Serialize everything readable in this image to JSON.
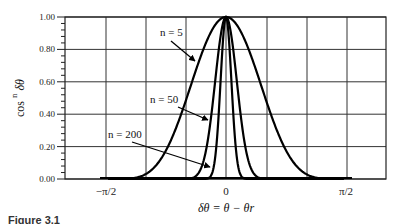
{
  "chart_data": {
    "type": "line",
    "title": "",
    "xlabel": "δθ = θ − θr",
    "ylabel": "cos^n δθ",
    "ylabel_base": "cos",
    "ylabel_exp": "n",
    "ylabel_var": "δθ",
    "xlim": [
      -2.1,
      2.1
    ],
    "ylim": [
      0,
      1
    ],
    "grid": true,
    "x_ticks": [
      {
        "value": -1.5708,
        "label": "−π/2"
      },
      {
        "value": 0,
        "label": "0"
      },
      {
        "value": 1.5708,
        "label": "π/2"
      }
    ],
    "y_ticks": [
      "0.00",
      "0.20",
      "0.40",
      "0.60",
      "0.80",
      "1.00"
    ],
    "y_minor_step": 0.04,
    "series": [
      {
        "name": "n = 5",
        "exponent": 5
      },
      {
        "name": "n = 50",
        "exponent": 50
      },
      {
        "name": "n = 200",
        "exponent": 200
      }
    ],
    "annotations": [
      {
        "text": "n = 5",
        "points_to": "n = 5"
      },
      {
        "text": "n = 50",
        "points_to": "n = 50"
      },
      {
        "text": "n = 200",
        "points_to": "n = 200"
      }
    ]
  },
  "caption": "Figure 3.1"
}
